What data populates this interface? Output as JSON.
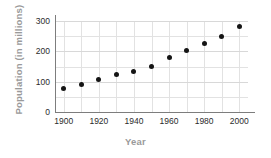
{
  "chart_data": {
    "type": "scatter",
    "title": "",
    "xlabel": "Year",
    "ylabel": "Population (in millions)",
    "x": [
      1900,
      1910,
      1920,
      1930,
      1940,
      1950,
      1960,
      1970,
      1980,
      1990,
      2000
    ],
    "values": [
      76,
      92,
      106,
      123,
      132,
      151,
      179,
      203,
      227,
      249,
      281
    ],
    "series": [
      {
        "name": "Population",
        "values": [
          76,
          92,
          106,
          123,
          132,
          151,
          179,
          203,
          227,
          249,
          281
        ]
      }
    ],
    "xlim": [
      1895,
      2005
    ],
    "ylim": [
      0,
      300
    ],
    "xticks": [
      1900,
      1920,
      1940,
      1960,
      1980,
      2000
    ],
    "xtick_labels": [
      "1900",
      "1920",
      "1940",
      "1960",
      "1980",
      "2000"
    ],
    "yticks": [
      0,
      100,
      200,
      300
    ],
    "ytick_labels": [
      "0",
      "100",
      "200",
      "300"
    ],
    "xgrid_minor": [
      1900,
      1910,
      1920,
      1930,
      1940,
      1950,
      1960,
      1970,
      1980,
      1990,
      2000
    ],
    "ygrid": [
      0,
      50,
      100,
      150,
      200,
      250,
      300
    ],
    "grid": true,
    "legend": false,
    "legend_position": "none",
    "marker": "filled-circle",
    "marker_color": "#151515",
    "grid_color": "#e2e2e2",
    "axis_color": "#7d7d7d",
    "label_color": "#9a9a9a",
    "tick_color": "#2b2b2b"
  }
}
